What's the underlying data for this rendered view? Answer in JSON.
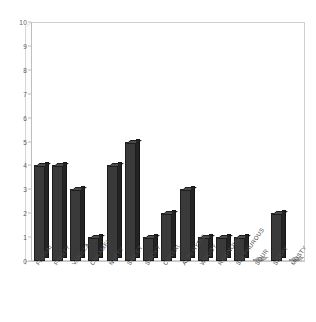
{
  "chart_data": {
    "type": "bar",
    "title": "",
    "subtitle": "",
    "xlabel": "",
    "ylabel": "",
    "ylim": [
      0,
      10
    ],
    "yticks": [
      0,
      1,
      2,
      3,
      4,
      5,
      6,
      7,
      8,
      9,
      10
    ],
    "grid": false,
    "legend": null,
    "style": "3d-column",
    "bar_color": "#3a3a3a",
    "plot_background": "#ffffff",
    "frame_color": "#cfcfcf",
    "categories": [
      "FLORAL",
      "FRUITY",
      "VANILLA",
      "CARAMEL",
      "NUTTY",
      "SWEET",
      "SMOKY",
      "CEREAL",
      "ALDEHYDIC",
      "WOODY",
      "RESINOUS",
      "SULPHUROUS",
      "SOUR",
      "SOAPY",
      "MUSTY"
    ],
    "values": [
      4,
      4,
      3,
      1,
      4,
      5,
      1,
      2,
      3,
      1,
      1,
      1,
      0,
      2,
      0
    ]
  }
}
